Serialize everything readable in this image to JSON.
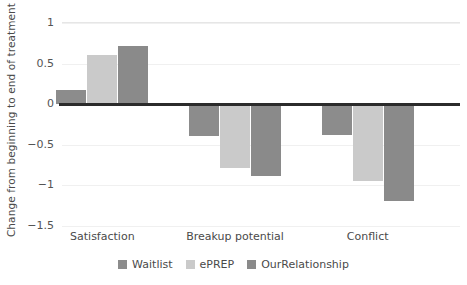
{
  "chart_data": {
    "type": "bar",
    "title": "",
    "xlabel": "",
    "ylabel": "Change from beginning to end of treatment",
    "categories": [
      "Satisfaction",
      "Breakup potential",
      "Conflict"
    ],
    "series": [
      {
        "name": "Waitlist",
        "color": "#8c8c8c",
        "values": [
          0.17,
          -0.39,
          -0.38
        ]
      },
      {
        "name": "ePREP",
        "color": "#cacaca",
        "values": [
          0.6,
          -0.79,
          -0.95
        ]
      },
      {
        "name": "OurRelationship",
        "color": "#8a8a8a",
        "values": [
          0.72,
          -0.88,
          -1.19
        ]
      }
    ],
    "ylim": [
      -1.5,
      1
    ],
    "yticks": [
      1,
      0.5,
      0,
      -0.5,
      -1,
      -1.5
    ],
    "ytick_labels": [
      "1",
      "0.5",
      "0",
      "−0.5",
      "−1",
      "−1.5"
    ],
    "grid": true,
    "legend_position": "bottom",
    "zero_line_color": "#2b2b2b",
    "gridline_color": "#f0f0f0",
    "background_color": "#ffffff"
  }
}
